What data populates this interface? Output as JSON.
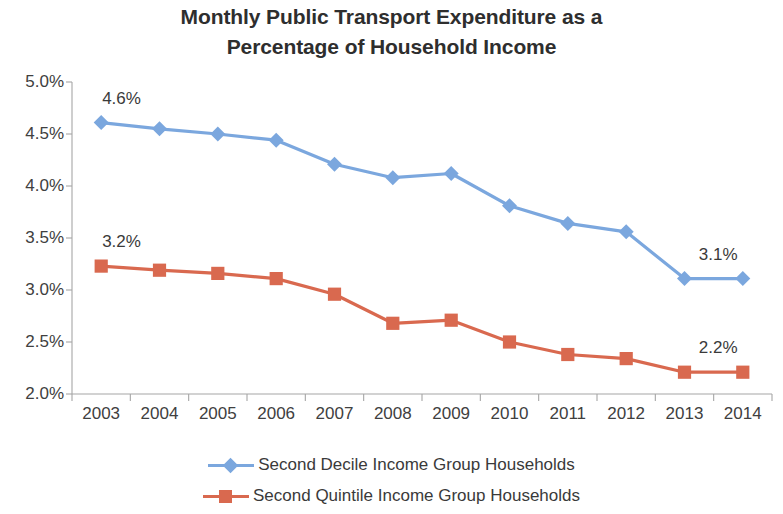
{
  "chart_data": {
    "type": "line",
    "title": "Monthly Public Transport Expenditure as a Percentage of Household Income",
    "title_lines": [
      "Monthly Public Transport Expenditure as a",
      "Percentage of Household Income"
    ],
    "xlabel": "",
    "ylabel": "",
    "categories": [
      "2003",
      "2004",
      "2005",
      "2006",
      "2007",
      "2008",
      "2009",
      "2010",
      "2011",
      "2012",
      "2013",
      "2014"
    ],
    "ylim": [
      2.0,
      5.0
    ],
    "ytick_labels": [
      "5.0%",
      "4.5%",
      "4.0%",
      "3.5%",
      "3.0%",
      "2.5%",
      "2.0%"
    ],
    "ytick_values": [
      5.0,
      4.5,
      4.0,
      3.5,
      3.0,
      2.5,
      2.0
    ],
    "grid": false,
    "legend_position": "bottom",
    "series": [
      {
        "name": "Second Decile Income Group Households",
        "color": "#7BA7DE",
        "marker": "diamond",
        "values": [
          4.61,
          4.55,
          4.5,
          4.44,
          4.21,
          4.08,
          4.12,
          3.81,
          3.64,
          3.56,
          3.11,
          3.11
        ]
      },
      {
        "name": "Second Quintile Income Group Households",
        "color": "#D9694F",
        "marker": "square",
        "values": [
          3.23,
          3.19,
          3.16,
          3.11,
          2.96,
          2.68,
          2.71,
          2.5,
          2.38,
          2.34,
          2.21,
          2.21
        ]
      }
    ],
    "annotations": [
      {
        "text": "4.6%",
        "series": 0,
        "category": "2003",
        "position": "above-right"
      },
      {
        "text": "3.1%",
        "series": 0,
        "category": "2014",
        "position": "above-left"
      },
      {
        "text": "3.2%",
        "series": 1,
        "category": "2003",
        "position": "above-right"
      },
      {
        "text": "2.2%",
        "series": 1,
        "category": "2014",
        "position": "above-left"
      }
    ]
  },
  "axis_colors": {
    "axis_line": "#a6a6a6",
    "tick": "#a6a6a6",
    "text": "#404040"
  }
}
